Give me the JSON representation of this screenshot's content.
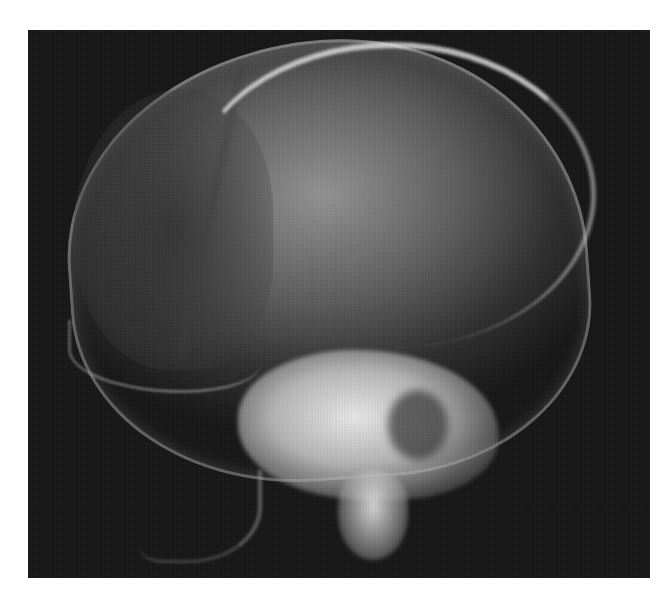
{
  "image": {
    "subject": "lateral skull radiograph",
    "background_color": "#ffffff",
    "film_color": "#161616",
    "bone_highlight_color": "#e8e8e8",
    "frame": {
      "left": 28,
      "top": 30,
      "width": 622,
      "height": 548
    }
  }
}
